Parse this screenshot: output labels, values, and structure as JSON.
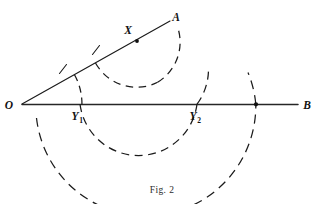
{
  "figure": {
    "caption": "Fig. 2",
    "background_color": "#ffffff",
    "ink_color": "#1b1b1b"
  },
  "points": {
    "O": {
      "label": "O",
      "x": 22,
      "y": 104,
      "role": "vertex-of-angle"
    },
    "A": {
      "label": "A",
      "x": 174,
      "y": 18,
      "role": "ray-endpoint-upper"
    },
    "B": {
      "label": "B",
      "x": 306,
      "y": 105,
      "role": "ray-endpoint-right"
    },
    "X": {
      "label": "X",
      "x": 137,
      "y": 41,
      "role": "marked-point-on-ray-OA"
    },
    "Y1": {
      "label": "Y",
      "subscript": "1",
      "x": 80,
      "y": 104,
      "role": "arc-intersection-on-OB-near"
    },
    "Y2": {
      "label": "Y",
      "subscript": "2",
      "x": 197,
      "y": 104,
      "role": "arc-intersection-on-OB-far"
    },
    "P3": {
      "label": "",
      "x": 256,
      "y": 104,
      "role": "arc-intersection-on-OB-outer"
    }
  },
  "rays": [
    {
      "name": "ray-OA",
      "from": "O",
      "to": "A",
      "x1": 22,
      "y1": 104,
      "x2": 170,
      "y2": 21
    },
    {
      "name": "ray-OB",
      "from": "O",
      "to": "B",
      "x1": 22,
      "y1": 104,
      "x2": 298,
      "y2": 104
    }
  ],
  "arcs": [
    {
      "name": "arc-centered-at-O",
      "center": "O",
      "cx": 22,
      "cy": 104,
      "radius": 60,
      "start_angle_deg": -29,
      "end_angle_deg": 2,
      "style": "dashed",
      "note": "small arc cutting ray OA and line OB at Y1"
    },
    {
      "name": "arc-centered-at-X",
      "center": "X",
      "cx": 137,
      "cy": 41,
      "radius": 47,
      "start_angle_deg": 152,
      "end_angle_deg": 64,
      "style": "dashed",
      "note": "arc below X sweeping from ray OA round to the right"
    },
    {
      "name": "arc-through-Y1-Y2",
      "center": "middle",
      "cx": 138,
      "cy": 92,
      "radius": 59,
      "start_angle_deg": 168,
      "end_angle_deg": 12,
      "style": "dashed",
      "note": "arc dipping below OB connecting Y1 and Y2"
    },
    {
      "name": "arc-outer-large",
      "center": "O",
      "cx": 146,
      "cy": 92,
      "radius": 110,
      "start_angle_deg": 178,
      "end_angle_deg": 3,
      "style": "dashed",
      "note": "large outer arc crossing OB at the far right point"
    }
  ],
  "tick_marks": [
    {
      "name": "tick-on-ray-OA-inner",
      "x": 63,
      "y": 69
    },
    {
      "name": "tick-on-ray-OA-outer",
      "x": 96,
      "y": 50
    }
  ],
  "labels": {
    "O": "O",
    "A": "A",
    "B": "B",
    "X": "X",
    "Y1_base": "Y",
    "Y1_sub": "1",
    "Y2_base": "Y",
    "Y2_sub": "2",
    "caption": "Fig. 2"
  }
}
